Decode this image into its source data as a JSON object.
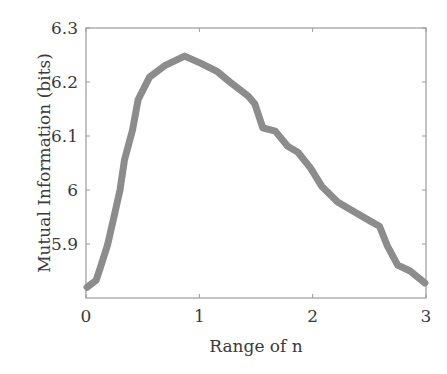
{
  "chart_data": {
    "type": "line",
    "title": "",
    "xlabel": "Range of n",
    "ylabel": "Mutual Information (bits)",
    "xlim": [
      0,
      3
    ],
    "ylim": [
      5.8,
      6.3
    ],
    "xticks": [
      0,
      1,
      2,
      3
    ],
    "xtick_labels": [
      "0",
      "1",
      "2",
      "3"
    ],
    "yticks": [
      5.9,
      6.0,
      6.1,
      6.2,
      6.3
    ],
    "ytick_labels": [
      "5.9",
      "6",
      "6.1",
      "6.2",
      "6.3"
    ],
    "grid": false,
    "legend": null,
    "series": [
      {
        "name": "Mutual Information",
        "color": "#8c8c8c",
        "x": [
          0.01,
          0.09,
          0.12,
          0.19,
          0.24,
          0.3,
          0.34,
          0.41,
          0.46,
          0.56,
          0.7,
          0.87,
          1.01,
          1.16,
          1.27,
          1.43,
          1.49,
          1.56,
          1.67,
          1.78,
          1.87,
          1.98,
          2.08,
          2.22,
          2.37,
          2.52,
          2.59,
          2.66,
          2.75,
          2.86,
          2.99
        ],
        "y": [
          5.82,
          5.833,
          5.852,
          5.898,
          5.944,
          6.0,
          6.056,
          6.111,
          6.167,
          6.209,
          6.231,
          6.248,
          6.235,
          6.219,
          6.2,
          6.174,
          6.159,
          6.115,
          6.109,
          6.081,
          6.07,
          6.041,
          6.007,
          5.978,
          5.959,
          5.941,
          5.933,
          5.896,
          5.861,
          5.85,
          5.828
        ]
      }
    ]
  },
  "layout": {
    "plot_left": 86,
    "plot_right": 426,
    "plot_top": 28,
    "plot_bottom": 298,
    "stroke_width": 7,
    "axis_color": "#9a9a9a"
  }
}
